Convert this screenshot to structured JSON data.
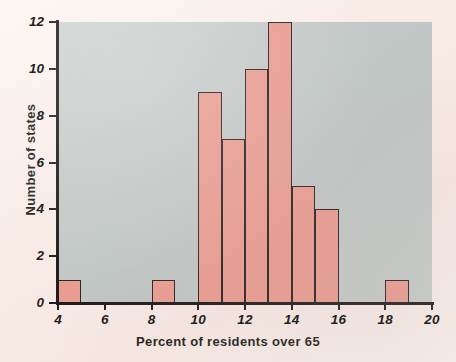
{
  "chart_data": {
    "type": "bar",
    "title": "",
    "subtitle": "",
    "xlabel": "Percent of residents over 65",
    "ylabel": "Number of states",
    "xlim": [
      4,
      20
    ],
    "ylim": [
      0,
      12
    ],
    "xticks": [
      4,
      6,
      8,
      10,
      12,
      14,
      16,
      18,
      20
    ],
    "yticks": [
      0,
      2,
      4,
      6,
      8,
      10,
      12
    ],
    "xtick_labels": [
      "4",
      "6",
      "8",
      "10",
      "12",
      "14",
      "16",
      "18",
      "20"
    ],
    "ytick_labels": [
      "0",
      "2",
      "4",
      "6",
      "8",
      "10",
      "12"
    ],
    "grid": false,
    "legend": null,
    "bin_width": 1,
    "bin_edges": [
      4,
      5,
      8,
      9,
      10,
      11,
      12,
      13,
      14,
      15,
      16,
      18,
      19
    ],
    "categories": [
      "4-5",
      "5-6",
      "6-7",
      "7-8",
      "8-9",
      "9-10",
      "10-11",
      "11-12",
      "12-13",
      "13-14",
      "14-15",
      "15-16",
      "16-17",
      "17-18",
      "18-19",
      "19-20"
    ],
    "values": [
      1,
      0,
      0,
      0,
      1,
      0,
      9,
      7,
      10,
      12,
      5,
      4,
      0,
      0,
      1,
      0
    ],
    "bars": [
      {
        "x0": 4,
        "x1": 5,
        "value": 1
      },
      {
        "x0": 8,
        "x1": 9,
        "value": 1
      },
      {
        "x0": 10,
        "x1": 11,
        "value": 9
      },
      {
        "x0": 11,
        "x1": 12,
        "value": 7
      },
      {
        "x0": 12,
        "x1": 13,
        "value": 10
      },
      {
        "x0": 13,
        "x1": 14,
        "value": 12
      },
      {
        "x0": 14,
        "x1": 15,
        "value": 5
      },
      {
        "x0": 15,
        "x1": 16,
        "value": 4
      },
      {
        "x0": 18,
        "x1": 19,
        "value": 1
      }
    ],
    "colors": {
      "bar_fill": "#e99d92",
      "bar_edge": "#2b2523",
      "plot_background": "#c5cac8",
      "figure_background": "#f8ebe6",
      "axis": "#211d1c",
      "text": "#241f1e"
    }
  }
}
